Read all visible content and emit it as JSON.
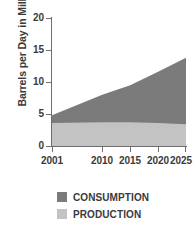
{
  "chart_data": {
    "type": "area",
    "stacked": true,
    "title": "",
    "xlabel": "",
    "ylabel": "Barrels per Day in Millions",
    "x": [
      2001,
      2010,
      2015,
      2020,
      2025
    ],
    "xtick_labels": [
      "2001",
      "2010",
      "2015",
      "2020",
      "2025"
    ],
    "ytick_labels": [
      "0",
      "5",
      "10",
      "15",
      "20"
    ],
    "yticks": [
      0,
      5,
      10,
      15,
      20
    ],
    "ylim": [
      0,
      20
    ],
    "xlim": [
      2001,
      2025
    ],
    "grid": false,
    "legend_position": "bottom-left",
    "series": [
      {
        "name": "CONSUMPTION",
        "color": "#7b7b7b",
        "values": [
          4.8,
          8.0,
          9.5,
          11.6,
          13.8
        ]
      },
      {
        "name": "PRODUCTION",
        "color": "#c3c3c3",
        "values": [
          3.6,
          3.7,
          3.7,
          3.6,
          3.4
        ]
      }
    ]
  },
  "legend": {
    "items": [
      {
        "label": "CONSUMPTION",
        "color": "#7b7b7b"
      },
      {
        "label": "PRODUCTION",
        "color": "#c3c3c3"
      }
    ]
  },
  "colors": {
    "consumption": "#7b7b7b",
    "production": "#c3c3c3",
    "axis": "#6e6e6e",
    "text": "#3a3a3a",
    "background": "#ffffff"
  }
}
